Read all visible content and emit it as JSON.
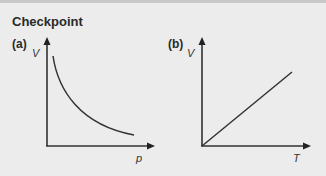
{
  "title": "Checkpoint",
  "panels": [
    {
      "label": "(a)",
      "y_axis": "V",
      "x_axis": "p",
      "curve": "inverse (hyperbola)"
    },
    {
      "label": "(b)",
      "y_axis": "V",
      "x_axis": "T",
      "curve": "straight line through origin"
    }
  ],
  "colors": {
    "background": "#ececec",
    "ink": "#333333"
  }
}
